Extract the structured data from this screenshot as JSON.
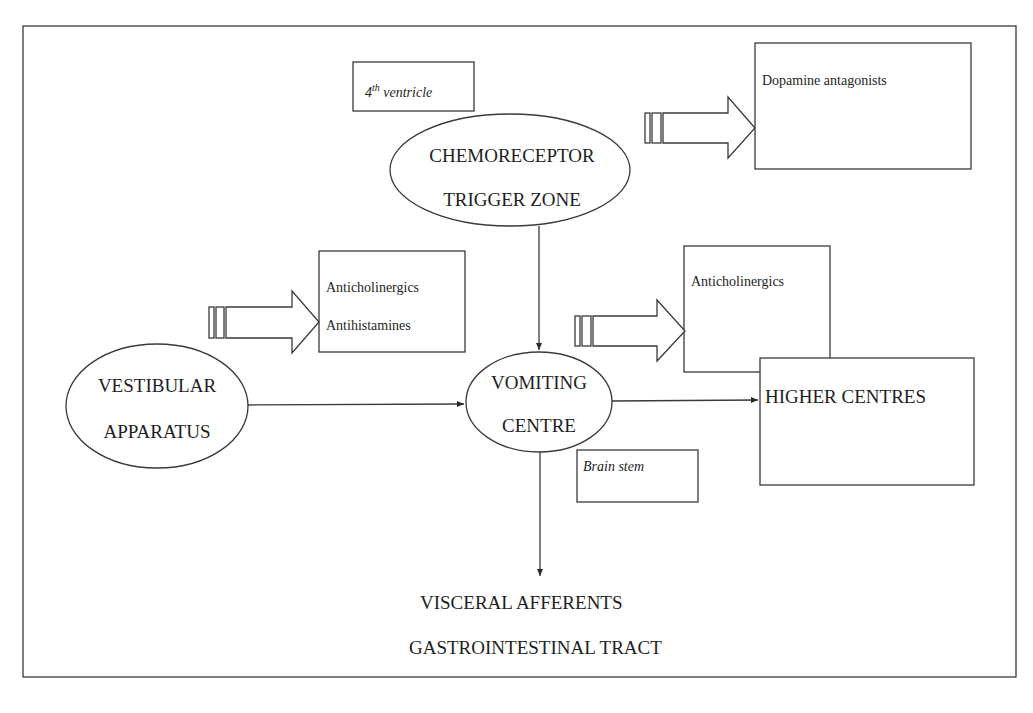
{
  "diagram": {
    "nodes": {
      "ctz": {
        "line1": "CHEMORECEPTOR",
        "line2": "TRIGGER ZONE"
      },
      "vomiting_centre": {
        "line1": "VOMITING",
        "line2": "CENTRE"
      },
      "vestibular": {
        "line1": "VESTIBULAR",
        "line2": "APPARATUS"
      },
      "higher_centres": {
        "label": "HIGHER CENTRES"
      },
      "visceral": {
        "line1": "VISCERAL AFFERENTS",
        "line2": "GASTROINTESTINAL TRACT"
      }
    },
    "location_labels": {
      "ctz_location": {
        "base": "4",
        "sup": "th",
        "rest": " ventricle"
      },
      "vc_location": {
        "label": "Brain stem"
      }
    },
    "drug_boxes": {
      "ctz_drugs": {
        "items": [
          "Dopamine antagonists"
        ]
      },
      "vestibular_drugs": {
        "items": [
          "Anticholinergics",
          "Antihistamines"
        ]
      },
      "higher_drugs": {
        "items": [
          "Anticholinergics"
        ]
      }
    },
    "edges": [
      {
        "from": "ctz",
        "to": "vomiting_centre",
        "type": "arrow"
      },
      {
        "from": "vestibular",
        "to": "vomiting_centre",
        "type": "arrow"
      },
      {
        "from": "vomiting_centre",
        "to": "higher_centres",
        "type": "arrow"
      },
      {
        "from": "vomiting_centre",
        "to": "visceral",
        "type": "arrow"
      }
    ],
    "colors": {
      "stroke": "#3a3a3a",
      "text": "#1e1e1e",
      "background": "#ffffff"
    }
  }
}
